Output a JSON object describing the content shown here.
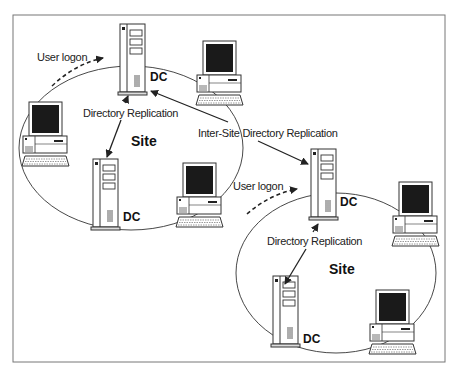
{
  "diagram": {
    "sites": [
      {
        "label": "Site",
        "dc_labels": [
          "DC",
          "DC"
        ],
        "replication_label": "Directory Replication",
        "user_logon_label": "User logon"
      },
      {
        "label": "Site",
        "dc_labels": [
          "DC",
          "DC"
        ],
        "replication_label": "Directory Replication",
        "user_logon_label": "User logon"
      }
    ],
    "inter_site_label": "Inter-Site Directory Replication",
    "colors": {
      "line": "#333333",
      "frame": "#777777",
      "screen": "#1a1a1a",
      "background": "#ffffff"
    }
  }
}
